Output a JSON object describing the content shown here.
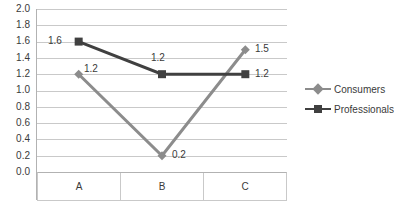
{
  "chart_data": {
    "type": "line",
    "title": "",
    "subtitle": "",
    "xlabel": "",
    "ylabel": "",
    "categories": [
      "A",
      "B",
      "C"
    ],
    "ylim": [
      0.0,
      2.0
    ],
    "ytick_step": 0.2,
    "yticks": [
      "2.0",
      "1.8",
      "1.6",
      "1.4",
      "1.2",
      "1.0",
      "0.8",
      "0.6",
      "0.4",
      "0.2",
      "0.0"
    ],
    "grid": "horizontal",
    "legend_position": "right",
    "series": [
      {
        "name": "Consumers",
        "values": [
          1.2,
          0.2,
          1.5
        ],
        "labels": [
          "1.2",
          "0.2",
          "1.5"
        ],
        "color": "#8c8c8c",
        "marker": "diamond"
      },
      {
        "name": "Professionals",
        "values": [
          1.6,
          1.2,
          1.2
        ],
        "labels": [
          "1.6",
          "1.2",
          "1.2"
        ],
        "color": "#404040",
        "marker": "square"
      }
    ],
    "gridline_color": "#c9c9c9",
    "axis_color": "#b2b2b2",
    "text_color": "#3a3a3a",
    "background": "#ffffff"
  }
}
